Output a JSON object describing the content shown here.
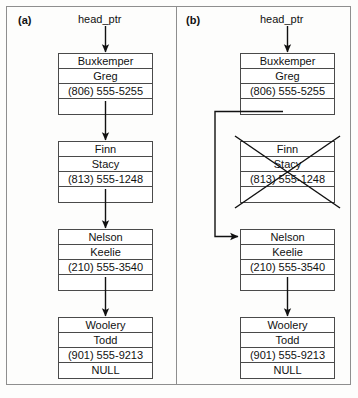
{
  "figure": {
    "panels": [
      {
        "label": "(a)",
        "pointer_label": "head_ptr",
        "nodes": [
          {
            "last_name": "Buxkemper",
            "first_name": "Greg",
            "phone": "(806) 555-5255",
            "next": "",
            "struck_out": false
          },
          {
            "last_name": "Finn",
            "first_name": "Stacy",
            "phone": "(813) 555-1248",
            "next": "",
            "struck_out": false
          },
          {
            "last_name": "Nelson",
            "first_name": "Keelie",
            "phone": "(210) 555-3540",
            "next": "",
            "struck_out": false
          },
          {
            "last_name": "Woolery",
            "first_name": "Todd",
            "phone": "(901) 555-9213",
            "next": "NULL",
            "struck_out": false
          }
        ]
      },
      {
        "label": "(b)",
        "pointer_label": "head_ptr",
        "nodes": [
          {
            "last_name": "Buxkemper",
            "first_name": "Greg",
            "phone": "(806) 555-5255",
            "next": "",
            "struck_out": false
          },
          {
            "last_name": "Finn",
            "first_name": "Stacy",
            "phone": "(813) 555-1248",
            "next": "",
            "struck_out": true
          },
          {
            "last_name": "Nelson",
            "first_name": "Keelie",
            "phone": "(210) 555-3540",
            "next": "",
            "struck_out": false
          },
          {
            "last_name": "Woolery",
            "first_name": "Todd",
            "phone": "(901) 555-9213",
            "next": "NULL",
            "struck_out": false
          }
        ]
      }
    ],
    "colors": {
      "line": "#111111",
      "node_border": "#4a4a4a",
      "frame_border": "#8e8e8e",
      "background": "#fdfdfc",
      "text": "#111111"
    }
  }
}
